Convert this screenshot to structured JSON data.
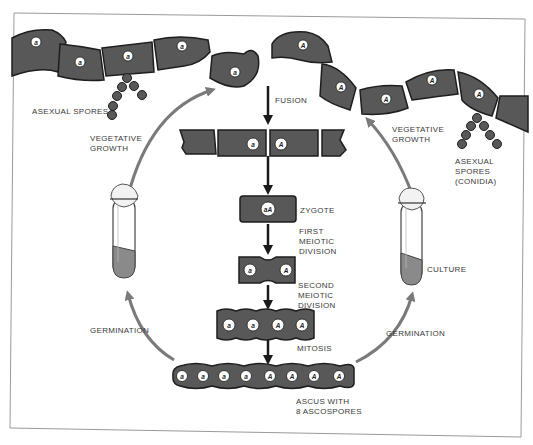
{
  "diagram": {
    "type": "life-cycle",
    "colors": {
      "cell_fill": "#585858",
      "cell_stroke": "#1e1e1e",
      "nucleus_fill": "#ffffff",
      "arrow_gray": "#7a7a7a",
      "arrow_black": "#1a1a1a",
      "frame": "#9a9a9a",
      "culture_medium": "#8a8a8a"
    },
    "labels": {
      "fusion": "FUSION",
      "zygote": "ZYGOTE",
      "first_meiotic": "FIRST\nMEIOTIC\nDIVISION",
      "second_meiotic": "SECOND\nMEIOTIC\nDIVISION",
      "mitosis": "MITOSIS",
      "ascus": "ASCUS WITH\n8 ASCOSPORES",
      "asexual_spores_left": "ASEXUAL SPORES",
      "asexual_spores_right": "ASEXUAL\nSPORES\n(CONIDIA)",
      "vegetative_growth_left": "VEGETATIVE\nGROWTH",
      "vegetative_growth_right": "VEGETATIVE\nGROWTH",
      "germination_left": "GERMINATION",
      "germination_right": "GERMINATION",
      "culture": "CULTURE"
    },
    "nuclei": {
      "left_hypha": [
        "a",
        "a",
        "a",
        "a",
        "a"
      ],
      "right_hypha": [
        "A",
        "A",
        "A",
        "A",
        "A"
      ],
      "fusion_row": [
        "a",
        "A"
      ],
      "zygote": [
        "aA"
      ],
      "first_meiotic": [
        "a",
        "A"
      ],
      "second_meiotic": [
        "a",
        "a",
        "A",
        "A"
      ],
      "ascus": [
        "a",
        "a",
        "a",
        "a",
        "A",
        "A",
        "A",
        "A"
      ]
    }
  }
}
